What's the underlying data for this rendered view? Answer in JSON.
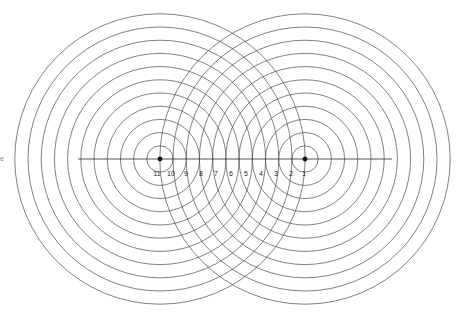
{
  "figure": {
    "background_color": "#ffffff",
    "width": 460,
    "height": 315
  },
  "style": {
    "circle_stroke": "#4a4a4a",
    "circle_stroke_width": 0.7,
    "axis_stroke": "#2b2b2b",
    "axis_stroke_width": 0.8,
    "dot_color": "#111111",
    "label_color": "#222222",
    "label_font_size": 7,
    "edge_mark_color": "#8d8d8d"
  },
  "sources": [
    {
      "name": "left-source",
      "cx": 160,
      "cy": 159,
      "dot_radius": 2.2,
      "ring_count": 11,
      "ring_spacing": 13.2,
      "first_ring_radius": 13.2
    },
    {
      "name": "right-source",
      "cx": 305,
      "cy": 159,
      "dot_radius": 2.2,
      "ring_count": 11,
      "ring_spacing": 13.2,
      "first_ring_radius": 13.2
    }
  ],
  "axis": {
    "name": "horizontal-axis",
    "x1": 78,
    "x2": 392,
    "y": 159
  },
  "tick_labels": {
    "y": 174,
    "items": [
      {
        "text": "11",
        "x": 157
      },
      {
        "text": "10",
        "x": 171
      },
      {
        "text": "9",
        "x": 186
      },
      {
        "text": "8",
        "x": 201
      },
      {
        "text": "7",
        "x": 216
      },
      {
        "text": "6",
        "x": 231
      },
      {
        "text": "5",
        "x": 246
      },
      {
        "text": "4",
        "x": 261
      },
      {
        "text": "3",
        "x": 276
      },
      {
        "text": "2",
        "x": 291
      },
      {
        "text": "1",
        "x": 304
      }
    ]
  },
  "edge_marks": [
    {
      "name": "left-edge-fragment",
      "text": "e",
      "x": 0,
      "y": 159
    }
  ],
  "chart_data": {
    "type": "diagram",
    "series": [
      {
        "name": "left-source-wavefronts",
        "center": [
          160,
          159
        ],
        "radii": [
          13.2,
          26.4,
          39.6,
          52.8,
          66.0,
          79.2,
          92.4,
          105.6,
          118.8,
          132.0,
          145.2
        ]
      },
      {
        "name": "right-source-wavefronts",
        "center": [
          305,
          159
        ],
        "radii": [
          13.2,
          26.4,
          39.6,
          52.8,
          66.0,
          79.2,
          92.4,
          105.6,
          118.8,
          132.0,
          145.2
        ]
      }
    ],
    "annotations": [
      "11",
      "10",
      "9",
      "8",
      "7",
      "6",
      "5",
      "4",
      "3",
      "2",
      "1"
    ],
    "xlabel": "",
    "ylabel": "",
    "grid": false,
    "legend": "none"
  }
}
